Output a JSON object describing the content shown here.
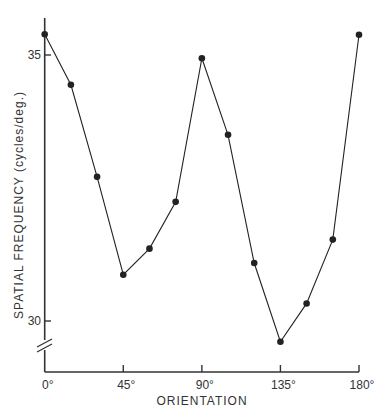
{
  "chart_data": {
    "type": "line",
    "title": "",
    "xlabel": "ORIENTATION",
    "ylabel": "SPATIAL FREQUENCY (cycles/deg.)",
    "x": [
      0,
      15,
      30,
      45,
      60,
      75,
      90,
      105,
      120,
      135,
      150,
      165,
      180
    ],
    "series": [
      {
        "name": "spatial frequency",
        "values": [
          35.39,
          34.44,
          32.71,
          30.87,
          31.36,
          32.24,
          34.94,
          33.5,
          31.09,
          29.61,
          30.33,
          31.53,
          35.38
        ],
        "marker": "filled-circle",
        "color": "#222222"
      }
    ],
    "xticks": [
      {
        "value": 0,
        "label": "0°"
      },
      {
        "value": 45,
        "label": "45°"
      },
      {
        "value": 90,
        "label": "90°"
      },
      {
        "value": 135,
        "label": "135°"
      },
      {
        "value": 180,
        "label": "180°"
      }
    ],
    "yticks": [
      {
        "value": 30,
        "label": "30"
      },
      {
        "value": 35,
        "label": "35"
      }
    ],
    "xlim": [
      0,
      180
    ],
    "ylim": [
      29,
      35.4
    ],
    "y_axis_break": true,
    "grid": false,
    "legend": null
  }
}
